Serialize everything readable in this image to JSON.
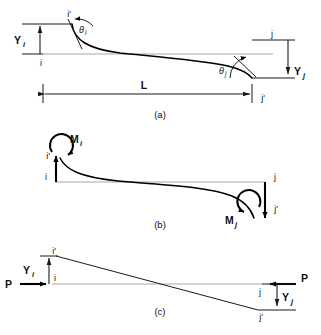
{
  "figure": {
    "type": "structural-beam-end-conditions-diagram",
    "background_color": "#ffffff",
    "ink_color": "#111111",
    "axis_color": "#a8a8a8",
    "panels": [
      {
        "id": "a",
        "caption": "(a)",
        "description": "Beam with end displacements Yi and Yj and end rotations theta-i and theta-j",
        "labels": {
          "node_i": "i",
          "node_i_prime": "i'",
          "node_j": "j",
          "node_j_prime": "j'",
          "disp_i": "Y",
          "disp_i_sub": "i",
          "disp_j": "Y",
          "disp_j_sub": "j",
          "theta_i": "θ",
          "theta_i_sub": "i",
          "theta_j": "θ",
          "theta_j_sub": "j",
          "length": "L"
        }
      },
      {
        "id": "b",
        "caption": "(b)",
        "description": "Beam with end moments Mi and Mj applied at nodes i and j",
        "labels": {
          "node_i": "i",
          "node_i_prime": "i'",
          "node_j": "j",
          "node_j_prime": "j'",
          "moment_i": "M",
          "moment_i_sub": "i",
          "moment_j": "M",
          "moment_j_sub": "j"
        }
      },
      {
        "id": "c",
        "caption": "(c)",
        "description": "Beam with axial forces P applied at both ends and transverse offsets Yi and Yj",
        "labels": {
          "node_i": "i",
          "node_i_prime": "i'",
          "node_j": "j",
          "node_j_prime": "j'",
          "force_left": "P",
          "force_right": "P",
          "disp_i": "Y",
          "disp_i_sub": "i",
          "disp_j": "Y",
          "disp_j_sub": "j"
        }
      }
    ]
  }
}
